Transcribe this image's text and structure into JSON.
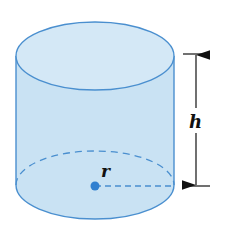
{
  "diagram": {
    "labels": {
      "height": "h",
      "radius": "r"
    },
    "colors": {
      "fill": "#cfe6f5",
      "side_fill": "#c6e0f2",
      "stroke": "#4a8fcf",
      "center_dot": "#2f7fd0",
      "dimension": "#111111"
    }
  }
}
